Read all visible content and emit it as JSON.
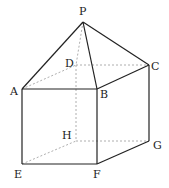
{
  "diagram": {
    "colors": {
      "solid": "#222222",
      "hidden": "#999999",
      "background": "#ffffff"
    },
    "points": {
      "P": {
        "label": "P",
        "x": 83,
        "y": 22
      },
      "A": {
        "label": "A",
        "x": 22,
        "y": 89
      },
      "B": {
        "label": "B",
        "x": 97,
        "y": 89
      },
      "C": {
        "label": "C",
        "x": 149,
        "y": 65
      },
      "D": {
        "label": "D",
        "x": 76,
        "y": 65
      },
      "E": {
        "label": "E",
        "x": 22,
        "y": 164
      },
      "F": {
        "label": "F",
        "x": 97,
        "y": 164
      },
      "G": {
        "label": "G",
        "x": 149,
        "y": 141
      },
      "H": {
        "label": "H",
        "x": 76,
        "y": 141
      }
    },
    "visible_edges": [
      "PA",
      "PB",
      "PC",
      "AB",
      "BC",
      "AE",
      "BF",
      "CG",
      "EF",
      "FG"
    ],
    "hidden_edges": [
      "PD",
      "AD",
      "DC",
      "DH",
      "EH",
      "HG"
    ]
  }
}
